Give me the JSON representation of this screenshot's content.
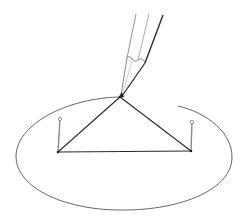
{
  "figure": {
    "title": "Drawing an ellipse with two pins, a string loop and a pencil",
    "colors": {
      "background": "#ffffff",
      "ellipse": "#555555",
      "string": "#2a2a2a",
      "pin": "#8a8a8a",
      "pencil": "#3a3a3a"
    },
    "ellipse": {
      "cx": 124,
      "cy": 155,
      "rx": 108,
      "ry": 55
    },
    "pins": [
      {
        "name": "left-focus-pin",
        "base": [
          58,
          152
        ],
        "head": [
          60,
          119
        ]
      },
      {
        "name": "right-focus-pin",
        "base": [
          191,
          151
        ],
        "head": [
          192,
          122
        ]
      }
    ],
    "pencil_tip": [
      120,
      97
    ]
  }
}
